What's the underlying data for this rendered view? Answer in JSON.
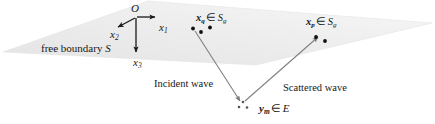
{
  "figure": {
    "width": 435,
    "height": 124,
    "background_color": "#ffffff",
    "plane_fill_color": "#ebebeb",
    "line_color": "#6b6b6b",
    "dot_color": "#111111",
    "text_color": "#181818"
  },
  "plane": {
    "name": "free boundary surface",
    "label_text": "free boundary",
    "label_symbol": "S",
    "vertices": "3,52 148,1 432,23 256,65"
  },
  "axes": {
    "origin_label": "O",
    "axis_1": {
      "label": "x",
      "subscript": "1",
      "direction": "right"
    },
    "axis_2": {
      "label": "x",
      "subscript": "2",
      "direction": "lower-left"
    },
    "axis_3": {
      "label": "x",
      "subscript": "3",
      "direction": "down"
    }
  },
  "points": {
    "source_group": {
      "symbol": "x",
      "symbol_subscript": "q",
      "membership": "∈",
      "set": "S",
      "set_subscript": "g"
    },
    "receiver_group": {
      "symbol": "x",
      "symbol_subscript": "p",
      "membership": "∈",
      "set": "S",
      "set_subscript": "g"
    },
    "scatterer": {
      "symbol": "y",
      "symbol_subscript": "m",
      "membership": "∈",
      "set": "E"
    }
  },
  "waves": {
    "incident_label": "Incident wave",
    "scattered_label": "Scattered wave"
  }
}
